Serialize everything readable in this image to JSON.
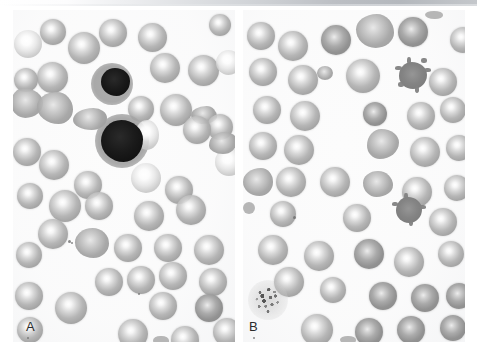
{
  "figure": {
    "type": "photomicrograph",
    "background_color": "#ffffff",
    "width": 477,
    "height": 357
  },
  "scan_artifact": {
    "name": "top-gray-band",
    "color": "#b8bcc0"
  },
  "panels": [
    {
      "id": "A",
      "label": "A",
      "x": 13,
      "y": 10,
      "width": 222,
      "height": 332,
      "background_color": "#fcfcfc",
      "features": [
        "numerous red blood cells with prominent central pallor",
        "two darkly stained nucleated cells",
        "occasional elongated / crenated forms"
      ],
      "cells": [
        {
          "kind": "rbc",
          "cx": 40,
          "cy": 22,
          "r": 13
        },
        {
          "kind": "rbc-pale",
          "cx": 15,
          "cy": 34,
          "r": 12
        },
        {
          "kind": "rbc",
          "cx": 71,
          "cy": 38,
          "r": 16
        },
        {
          "kind": "rbc",
          "cx": 99,
          "cy": 24,
          "r": 13
        },
        {
          "kind": "rbc",
          "cx": 139,
          "cy": 28,
          "r": 14
        },
        {
          "kind": "rbc",
          "cx": 40,
          "cy": 68,
          "r": 15
        },
        {
          "kind": "rbc",
          "cx": 152,
          "cy": 58,
          "r": 14
        },
        {
          "kind": "rbc",
          "cx": 190,
          "cy": 60,
          "r": 15
        },
        {
          "kind": "rbc-pale",
          "cx": 215,
          "cy": 52,
          "r": 12
        },
        {
          "kind": "nucleated",
          "cx": 105,
          "cy": 78,
          "r": 16
        },
        {
          "kind": "irregular",
          "cx": 16,
          "cy": 95,
          "r": 14
        },
        {
          "kind": "irregular",
          "cx": 42,
          "cy": 101,
          "r": 15
        },
        {
          "kind": "rbc",
          "cx": 128,
          "cy": 100,
          "r": 13
        },
        {
          "kind": "rbc",
          "cx": 163,
          "cy": 100,
          "r": 15
        },
        {
          "kind": "irregular",
          "cx": 75,
          "cy": 112,
          "r": 13
        },
        {
          "kind": "rbc",
          "cx": 184,
          "cy": 120,
          "r": 14
        },
        {
          "kind": "rbc",
          "cx": 207,
          "cy": 118,
          "r": 12
        },
        {
          "kind": "nucleated",
          "cx": 112,
          "cy": 135,
          "r": 19
        },
        {
          "kind": "rbc",
          "cx": 14,
          "cy": 142,
          "r": 14
        },
        {
          "kind": "rbc",
          "cx": 41,
          "cy": 155,
          "r": 15
        },
        {
          "kind": "rbc-pale",
          "cx": 216,
          "cy": 152,
          "r": 14
        },
        {
          "kind": "rbc",
          "cx": 75,
          "cy": 175,
          "r": 14
        },
        {
          "kind": "rbc-pale",
          "cx": 133,
          "cy": 168,
          "r": 15
        },
        {
          "kind": "rbc",
          "cx": 166,
          "cy": 180,
          "r": 14
        },
        {
          "kind": "rbc",
          "cx": 17,
          "cy": 186,
          "r": 13
        },
        {
          "kind": "rbc",
          "cx": 52,
          "cy": 196,
          "r": 16
        },
        {
          "kind": "rbc",
          "cx": 86,
          "cy": 196,
          "r": 14
        },
        {
          "kind": "rbc",
          "cx": 178,
          "cy": 200,
          "r": 15
        },
        {
          "kind": "rbc",
          "cx": 136,
          "cy": 206,
          "r": 15
        },
        {
          "kind": "rbc",
          "cx": 40,
          "cy": 224,
          "r": 15
        },
        {
          "kind": "rbc",
          "cx": 78,
          "cy": 236,
          "r": 15
        },
        {
          "kind": "rbc",
          "cx": 16,
          "cy": 245,
          "r": 13
        },
        {
          "kind": "rbc",
          "cx": 115,
          "cy": 238,
          "r": 14
        },
        {
          "kind": "rbc",
          "cx": 155,
          "cy": 238,
          "r": 14
        },
        {
          "kind": "rbc",
          "cx": 196,
          "cy": 240,
          "r": 15
        },
        {
          "kind": "rbc",
          "cx": 96,
          "cy": 272,
          "r": 14
        },
        {
          "kind": "rbc",
          "cx": 128,
          "cy": 270,
          "r": 14
        },
        {
          "kind": "rbc",
          "cx": 160,
          "cy": 266,
          "r": 14
        },
        {
          "kind": "rbc",
          "cx": 200,
          "cy": 272,
          "r": 14
        },
        {
          "kind": "rbc",
          "cx": 16,
          "cy": 286,
          "r": 14
        },
        {
          "kind": "rbc",
          "cx": 58,
          "cy": 298,
          "r": 16
        },
        {
          "kind": "rbc",
          "cx": 150,
          "cy": 296,
          "r": 14
        },
        {
          "kind": "rbc-dense",
          "cx": 196,
          "cy": 298,
          "r": 14
        },
        {
          "kind": "rbc",
          "cx": 17,
          "cy": 320,
          "r": 13
        },
        {
          "kind": "rbc",
          "cx": 120,
          "cy": 324,
          "r": 15
        },
        {
          "kind": "rbc",
          "cx": 172,
          "cy": 330,
          "r": 14
        },
        {
          "kind": "rbc",
          "cx": 214,
          "cy": 322,
          "r": 14
        }
      ]
    },
    {
      "id": "B",
      "label": "B",
      "x": 243,
      "y": 10,
      "width": 222,
      "height": 332,
      "background_color": "#fcfcfc",
      "features": [
        "red blood cells that are denser with reduced central pallor",
        "spiculated echinocyte / acanthocyte forms",
        "a large granular platelet aggregate in the lower left",
        "irregular and teardrop shaped cells"
      ],
      "cells": [
        {
          "kind": "rbc",
          "cx": 18,
          "cy": 26,
          "r": 14
        },
        {
          "kind": "rbc",
          "cx": 50,
          "cy": 36,
          "r": 15
        },
        {
          "kind": "rbc-dense",
          "cx": 93,
          "cy": 30,
          "r": 15
        },
        {
          "kind": "irregular",
          "cx": 130,
          "cy": 22,
          "r": 17
        },
        {
          "kind": "rbc-dense",
          "cx": 170,
          "cy": 22,
          "r": 15
        },
        {
          "kind": "echinocyte",
          "cx": 169,
          "cy": 65,
          "r": 14
        },
        {
          "kind": "rbc",
          "cx": 200,
          "cy": 72,
          "r": 14
        },
        {
          "kind": "rbc",
          "cx": 219,
          "cy": 30,
          "r": 13
        },
        {
          "kind": "rbc",
          "cx": 20,
          "cy": 62,
          "r": 14
        },
        {
          "kind": "rbc",
          "cx": 60,
          "cy": 70,
          "r": 15
        },
        {
          "kind": "rbc",
          "cx": 120,
          "cy": 66,
          "r": 17
        },
        {
          "kind": "rbc",
          "cx": 24,
          "cy": 100,
          "r": 14
        },
        {
          "kind": "rbc",
          "cx": 62,
          "cy": 106,
          "r": 15
        },
        {
          "kind": "rbc-dense",
          "cx": 132,
          "cy": 104,
          "r": 12
        },
        {
          "kind": "rbc",
          "cx": 178,
          "cy": 106,
          "r": 14
        },
        {
          "kind": "rbc",
          "cx": 210,
          "cy": 100,
          "r": 13
        },
        {
          "kind": "rbc",
          "cx": 20,
          "cy": 136,
          "r": 14
        },
        {
          "kind": "rbc",
          "cx": 56,
          "cy": 140,
          "r": 15
        },
        {
          "kind": "irregular",
          "cx": 140,
          "cy": 134,
          "r": 14
        },
        {
          "kind": "rbc",
          "cx": 182,
          "cy": 142,
          "r": 15
        },
        {
          "kind": "rbc",
          "cx": 216,
          "cy": 138,
          "r": 13
        },
        {
          "kind": "irregular",
          "cx": 16,
          "cy": 172,
          "r": 14
        },
        {
          "kind": "rbc",
          "cx": 48,
          "cy": 172,
          "r": 15
        },
        {
          "kind": "rbc",
          "cx": 92,
          "cy": 172,
          "r": 15
        },
        {
          "kind": "irregular",
          "cx": 136,
          "cy": 174,
          "r": 13
        },
        {
          "kind": "rbc",
          "cx": 174,
          "cy": 182,
          "r": 15
        },
        {
          "kind": "rbc",
          "cx": 214,
          "cy": 178,
          "r": 13
        },
        {
          "kind": "rbc",
          "cx": 40,
          "cy": 204,
          "r": 13
        },
        {
          "kind": "rbc",
          "cx": 114,
          "cy": 208,
          "r": 14
        },
        {
          "kind": "echinocyte",
          "cx": 166,
          "cy": 200,
          "r": 13
        },
        {
          "kind": "rbc",
          "cx": 200,
          "cy": 212,
          "r": 14
        },
        {
          "kind": "rbc",
          "cx": 30,
          "cy": 240,
          "r": 15
        },
        {
          "kind": "rbc",
          "cx": 76,
          "cy": 246,
          "r": 15
        },
        {
          "kind": "rbc-dense",
          "cx": 126,
          "cy": 244,
          "r": 15
        },
        {
          "kind": "rbc",
          "cx": 166,
          "cy": 252,
          "r": 15
        },
        {
          "kind": "rbc",
          "cx": 208,
          "cy": 244,
          "r": 13
        },
        {
          "kind": "rbc",
          "cx": 46,
          "cy": 272,
          "r": 15
        },
        {
          "kind": "rbc",
          "cx": 90,
          "cy": 280,
          "r": 13
        },
        {
          "kind": "rbc-dense",
          "cx": 140,
          "cy": 286,
          "r": 14
        },
        {
          "kind": "rbc-dense",
          "cx": 182,
          "cy": 288,
          "r": 14
        },
        {
          "kind": "rbc-dense",
          "cx": 216,
          "cy": 286,
          "r": 13
        },
        {
          "kind": "platelet",
          "cx": 25,
          "cy": 290,
          "r": 20
        },
        {
          "kind": "rbc",
          "cx": 74,
          "cy": 320,
          "r": 16
        },
        {
          "kind": "rbc-dense",
          "cx": 126,
          "cy": 322,
          "r": 14
        },
        {
          "kind": "rbc-dense",
          "cx": 168,
          "cy": 320,
          "r": 14
        },
        {
          "kind": "rbc-dense",
          "cx": 210,
          "cy": 318,
          "r": 13
        }
      ]
    }
  ]
}
